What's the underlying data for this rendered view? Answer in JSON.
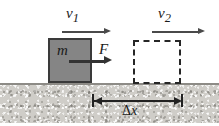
{
  "labels": {
    "velocity_initial": "v",
    "velocity_initial_sub": "1",
    "velocity_final": "v",
    "velocity_final_sub": "2",
    "mass": "m",
    "force": "F",
    "displacement_delta": "Δ",
    "displacement_var": "x"
  },
  "objects": {
    "solid_block": {
      "name": "block-initial-position",
      "fill": "#858585",
      "stroke": "#3a3a3a"
    },
    "dashed_block": {
      "name": "block-final-position",
      "stroke": "#262626",
      "style": "dashed"
    },
    "ground": {
      "name": "ground-surface",
      "fill": "#cfcdc8",
      "line": "#8d8b86"
    }
  },
  "colors": {
    "background": "#ffffff",
    "arrow": "#4a4a4a",
    "force_arrow": "#333333",
    "dimension": "#222222",
    "text": "#1a1a1a"
  }
}
